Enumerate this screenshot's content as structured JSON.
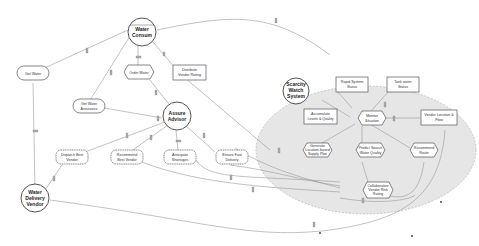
{
  "diagram": {
    "type": "actor-goal dependency diagram",
    "actors": [
      {
        "id": "water_consumer",
        "label": [
          "Water",
          "Consum"
        ]
      },
      {
        "id": "assure_advisor",
        "label": [
          "Assure",
          "Advisor"
        ]
      },
      {
        "id": "water_delivery_vendor",
        "label": [
          "Water",
          "Delivery",
          "Vendor"
        ]
      },
      {
        "id": "scarcity_watch_system",
        "label": [
          "Scarcity",
          "Watch",
          "System"
        ]
      }
    ],
    "nodes": [
      {
        "id": "get_water",
        "shape": "rounded",
        "label": [
          "Get Water"
        ]
      },
      {
        "id": "order_water",
        "shape": "hexagon",
        "label": [
          "Order Water"
        ]
      },
      {
        "id": "vendor_rating",
        "shape": "rect",
        "label": [
          "Distribute",
          "Vendor Rating"
        ]
      },
      {
        "id": "get_water_assurance",
        "shape": "rounded",
        "label": [
          "Get Water",
          "Assurance"
        ]
      },
      {
        "id": "dispatch_best_vendor",
        "shape": "cloud",
        "label": [
          "Dispatch Best",
          "Vendor"
        ]
      },
      {
        "id": "recommend_best_vendor",
        "shape": "cloud",
        "label": [
          "Recommend",
          "Best Vendor"
        ]
      },
      {
        "id": "anticipate_shortages",
        "shape": "cloud",
        "label": [
          "Anticipate",
          "Shortages"
        ]
      },
      {
        "id": "ensure_fast_delivery",
        "shape": "cloud",
        "label": [
          "Ensure Fast",
          "Delivery"
        ]
      },
      {
        "id": "rapid_system_status",
        "shape": "rect",
        "label": [
          "Rapid System",
          "Status"
        ]
      },
      {
        "id": "tank_water_status",
        "shape": "rect",
        "label": [
          "Tank water",
          "Status"
        ]
      },
      {
        "id": "accumulate_levels_quality",
        "shape": "rect",
        "label": [
          "Accumulate",
          "Levels & Quality"
        ]
      },
      {
        "id": "monitor_situation",
        "shape": "hexagon",
        "label": [
          "Monitor",
          "Situation"
        ]
      },
      {
        "id": "vendor_location_flow",
        "shape": "rect",
        "label": [
          "Vendor Location &",
          "Flow"
        ]
      },
      {
        "id": "generate_location_based_supply_plan",
        "shape": "hexagon",
        "label": [
          "Generate",
          "Location-based",
          "Supply Plan"
        ]
      },
      {
        "id": "predict_source_water_quality",
        "shape": "hexagon",
        "label": [
          "Predict Source",
          "Water Quality"
        ]
      },
      {
        "id": "recommend_route",
        "shape": "hexagon",
        "label": [
          "Recommend",
          "Route"
        ]
      },
      {
        "id": "collaborative_vendor_rating",
        "shape": "hexagon",
        "label": [
          "Collaborative",
          "Vendor Risk",
          "Rating"
        ]
      }
    ],
    "colors": {
      "boundary_fill": "#e6e6e6",
      "boundary_stroke": "#aaaaaa",
      "edge": "#999999",
      "node_stroke": "#555555"
    }
  }
}
